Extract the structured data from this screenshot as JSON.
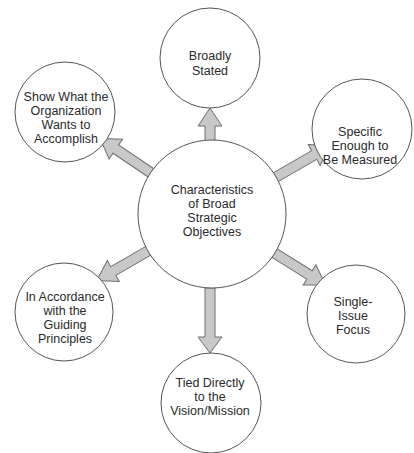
{
  "diagram": {
    "type": "hub-and-spoke",
    "colors": {
      "circle_stroke": "#555555",
      "circle_fill": "#ffffff",
      "arrow_fill": "#c8c8c8",
      "arrow_stroke": "#6e6e6e",
      "text": "#2a2a2a"
    },
    "center": {
      "lines": [
        "Characteristics",
        "of Broad",
        "Strategic",
        "Objectives"
      ]
    },
    "nodes": [
      {
        "id": "top",
        "lines": [
          "Broadly",
          "Stated"
        ]
      },
      {
        "id": "upper-right",
        "lines": [
          "Specific",
          "Enough to",
          "Be Measured"
        ]
      },
      {
        "id": "lower-right",
        "lines": [
          "Single-",
          "Issue",
          "Focus"
        ]
      },
      {
        "id": "bottom",
        "lines": [
          "Tied Directly",
          "to the",
          "Vision/Mission"
        ]
      },
      {
        "id": "lower-left",
        "lines": [
          "In Accordance",
          "with the",
          "Guiding",
          "Principles"
        ]
      },
      {
        "id": "upper-left",
        "lines": [
          "Show What the",
          "Organization",
          "Wants to",
          "Accomplish"
        ]
      }
    ]
  }
}
